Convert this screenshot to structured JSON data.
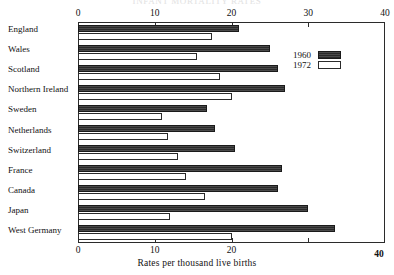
{
  "chart_data": {
    "type": "bar",
    "orientation": "horizontal",
    "title": "INFANT MORTALITY RATES",
    "xlabel": "Rates per thousand live births",
    "ylabel": "",
    "xlim": [
      0,
      40
    ],
    "grid": false,
    "legend_position": "upper-right",
    "xticks": [
      0,
      10,
      20,
      30,
      40
    ],
    "xticklabels_top": [
      "0",
      "10",
      "20",
      "30",
      "40"
    ],
    "xticklabels_bottom": [
      "0",
      "10",
      "20",
      "",
      "40"
    ],
    "categories": [
      "England",
      "Wales",
      "Scotland",
      "Northern Ireland",
      "Sweden",
      "Netherlands",
      "Switzerland",
      "France",
      "Canada",
      "Japan",
      "West Germany"
    ],
    "series": [
      {
        "name": "1960",
        "color": "#3a3a3a",
        "values": [
          21.0,
          25.0,
          26.0,
          27.0,
          16.8,
          17.9,
          20.5,
          26.6,
          26.1,
          30.0,
          33.5
        ]
      },
      {
        "name": "1972",
        "color": "#ffffff",
        "values": [
          17.5,
          15.5,
          18.5,
          20.0,
          11.0,
          11.7,
          13.0,
          14.1,
          16.5,
          12.0,
          20.0
        ]
      }
    ]
  },
  "legend": {
    "items": [
      {
        "label": "1960",
        "swatch": "dark-hatched"
      },
      {
        "label": "1972",
        "swatch": "white-outlined"
      }
    ]
  }
}
